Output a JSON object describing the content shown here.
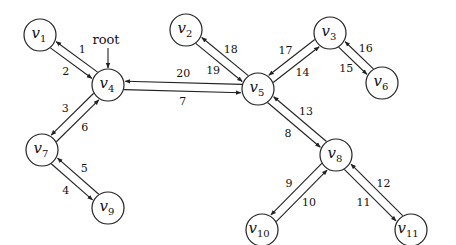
{
  "diagram": {
    "type": "euler-tour-tree",
    "root_label": "root",
    "root_node": "v4",
    "nodes": [
      {
        "id": "v1",
        "base": "v",
        "sub": "1",
        "x": 40,
        "y": 35
      },
      {
        "id": "v2",
        "base": "v",
        "sub": "2",
        "x": 186,
        "y": 30
      },
      {
        "id": "v3",
        "base": "v",
        "sub": "3",
        "x": 330,
        "y": 33
      },
      {
        "id": "v4",
        "base": "v",
        "sub": "4",
        "x": 108,
        "y": 85
      },
      {
        "id": "v5",
        "base": "v",
        "sub": "5",
        "x": 258,
        "y": 89
      },
      {
        "id": "v6",
        "base": "v",
        "sub": "6",
        "x": 382,
        "y": 83
      },
      {
        "id": "v7",
        "base": "v",
        "sub": "7",
        "x": 42,
        "y": 150
      },
      {
        "id": "v8",
        "base": "v",
        "sub": "8",
        "x": 336,
        "y": 155
      },
      {
        "id": "v9",
        "base": "v",
        "sub": "9",
        "x": 108,
        "y": 208
      },
      {
        "id": "v10",
        "base": "v",
        "sub": "10",
        "x": 262,
        "y": 230
      },
      {
        "id": "v11",
        "base": "v",
        "sub": "11",
        "x": 411,
        "y": 230
      }
    ],
    "edges": [
      {
        "from": "v4",
        "to": "v1",
        "label": "1"
      },
      {
        "from": "v1",
        "to": "v4",
        "label": "2"
      },
      {
        "from": "v4",
        "to": "v7",
        "label": "3"
      },
      {
        "from": "v7",
        "to": "v9",
        "label": "4"
      },
      {
        "from": "v9",
        "to": "v7",
        "label": "5"
      },
      {
        "from": "v7",
        "to": "v4",
        "label": "6"
      },
      {
        "from": "v4",
        "to": "v5",
        "label": "7"
      },
      {
        "from": "v5",
        "to": "v8",
        "label": "8"
      },
      {
        "from": "v8",
        "to": "v10",
        "label": "9"
      },
      {
        "from": "v10",
        "to": "v8",
        "label": "10"
      },
      {
        "from": "v8",
        "to": "v11",
        "label": "11"
      },
      {
        "from": "v11",
        "to": "v8",
        "label": "12"
      },
      {
        "from": "v8",
        "to": "v5",
        "label": "13"
      },
      {
        "from": "v5",
        "to": "v3",
        "label": "14"
      },
      {
        "from": "v3",
        "to": "v6",
        "label": "15"
      },
      {
        "from": "v6",
        "to": "v3",
        "label": "16"
      },
      {
        "from": "v3",
        "to": "v5",
        "label": "17"
      },
      {
        "from": "v5",
        "to": "v2",
        "label": "18"
      },
      {
        "from": "v2",
        "to": "v5",
        "label": "19"
      },
      {
        "from": "v5",
        "to": "v4",
        "label": "20"
      }
    ]
  }
}
